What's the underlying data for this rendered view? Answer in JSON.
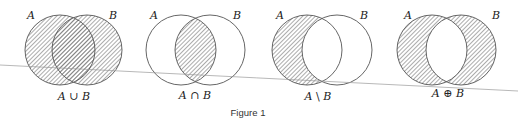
{
  "figure": {
    "caption": "Figure 1",
    "colors": {
      "outline": "#555555",
      "hatch": "#666666",
      "background": "#ffffff",
      "crossing_line": "#9a9a9a"
    },
    "diagrams": [
      {
        "id": "union",
        "set_a_label": "A",
        "set_b_label": "B",
        "operation": {
          "left": "A",
          "symbol": "∪",
          "right": "B"
        },
        "shaded_region": "A union B (both circles fully shaded)"
      },
      {
        "id": "intersection",
        "set_a_label": "A",
        "set_b_label": "B",
        "operation": {
          "left": "A",
          "symbol": "∩",
          "right": "B"
        },
        "shaded_region": "overlap of A and B only"
      },
      {
        "id": "difference",
        "set_a_label": "A",
        "set_b_label": "B",
        "operation": {
          "left": "A",
          "symbol": "\\",
          "right": "B"
        },
        "shaded_region": "A excluding overlap with B"
      },
      {
        "id": "symmetric-difference",
        "set_a_label": "A",
        "set_b_label": "B",
        "operation": {
          "left": "A",
          "symbol": "⊕",
          "right": "B"
        },
        "shaded_region": "A and B excluding their overlap"
      }
    ]
  }
}
